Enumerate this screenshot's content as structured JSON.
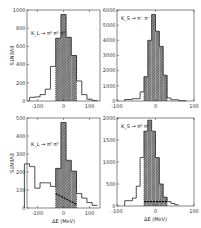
{
  "figure": {
    "ylabel": "EVENTS",
    "xlabel": "ΔE (MeV)"
  },
  "chart_data": [
    {
      "type": "bar",
      "panel": "top-left",
      "title": "K_L → π+ π- π0",
      "label": "K_L → π⁰ π⁰ π⁰",
      "xlabel": "",
      "ylabel": "EVENTS",
      "xlim": [
        -140,
        140
      ],
      "ylim": [
        0,
        1000
      ],
      "xticks": [
        "-100",
        "0",
        "100"
      ],
      "yticks": [
        "0",
        "200",
        "400",
        "600",
        "800",
        "1000"
      ],
      "bins": [
        -130,
        -110,
        -90,
        -70,
        -50,
        -30,
        -10,
        10,
        30,
        50,
        70,
        90,
        110,
        130
      ],
      "values": [
        40,
        45,
        70,
        130,
        380,
        690,
        950,
        700,
        500,
        220,
        70,
        20,
        5
      ],
      "shaded_range": [
        -30,
        50
      ]
    },
    {
      "type": "bar",
      "panel": "top-right",
      "label": "K_S → π⁺ π⁻",
      "xlabel": "",
      "ylabel": "",
      "xlim": [
        -100,
        100
      ],
      "ylim": [
        0,
        6000
      ],
      "xticks": [
        "-100",
        "0",
        "100"
      ],
      "yticks": [
        "0",
        "1000",
        "2000",
        "3000",
        "4000",
        "5000",
        "6000"
      ],
      "bins": [
        -80,
        -60,
        -40,
        -30,
        -20,
        -10,
        0,
        10,
        20,
        30,
        40,
        60,
        80
      ],
      "values": [
        100,
        150,
        600,
        1600,
        4000,
        5700,
        4600,
        3600,
        1700,
        200,
        80,
        20
      ],
      "shaded_range": [
        -30,
        30
      ]
    },
    {
      "type": "bar",
      "panel": "bottom-left",
      "label": "K_L → π⁰ π⁰",
      "xlabel": "ΔE (MeV)",
      "ylabel": "EVENTS",
      "xlim": [
        -140,
        140
      ],
      "ylim": [
        0,
        500
      ],
      "xticks": [
        "-100",
        "0",
        "100"
      ],
      "yticks": [
        "0",
        "100",
        "200",
        "300",
        "400",
        "500"
      ],
      "bins": [
        -150,
        -130,
        -110,
        -90,
        -70,
        -50,
        -30,
        -10,
        10,
        30,
        50,
        70,
        90,
        110,
        130
      ],
      "values": [
        245,
        230,
        110,
        140,
        140,
        120,
        220,
        475,
        265,
        205,
        80,
        55,
        30,
        15
      ],
      "shaded_range": [
        -30,
        50
      ],
      "background_line": {
        "x": [
          -30,
          50
        ],
        "y": [
          80,
          20
        ]
      }
    },
    {
      "type": "bar",
      "panel": "bottom-right",
      "label": "K_S → π⁰ π⁰",
      "xlabel": "ΔE (MeV)",
      "ylabel": "",
      "xlim": [
        -100,
        100
      ],
      "ylim": [
        0,
        2000
      ],
      "xticks": [
        "-100",
        "0",
        "100"
      ],
      "yticks": [
        "0",
        "500",
        "1000",
        "1500",
        "2000"
      ],
      "bins": [
        -80,
        -60,
        -50,
        -40,
        -30,
        -20,
        -10,
        0,
        10,
        20,
        30,
        40,
        50,
        60
      ],
      "values": [
        120,
        180,
        450,
        1100,
        1700,
        1950,
        1700,
        1100,
        500,
        200,
        100,
        60,
        30
      ],
      "shaded_range": [
        -30,
        30
      ],
      "background_line": {
        "x": [
          -30,
          30
        ],
        "y": [
          100,
          100
        ]
      }
    }
  ]
}
